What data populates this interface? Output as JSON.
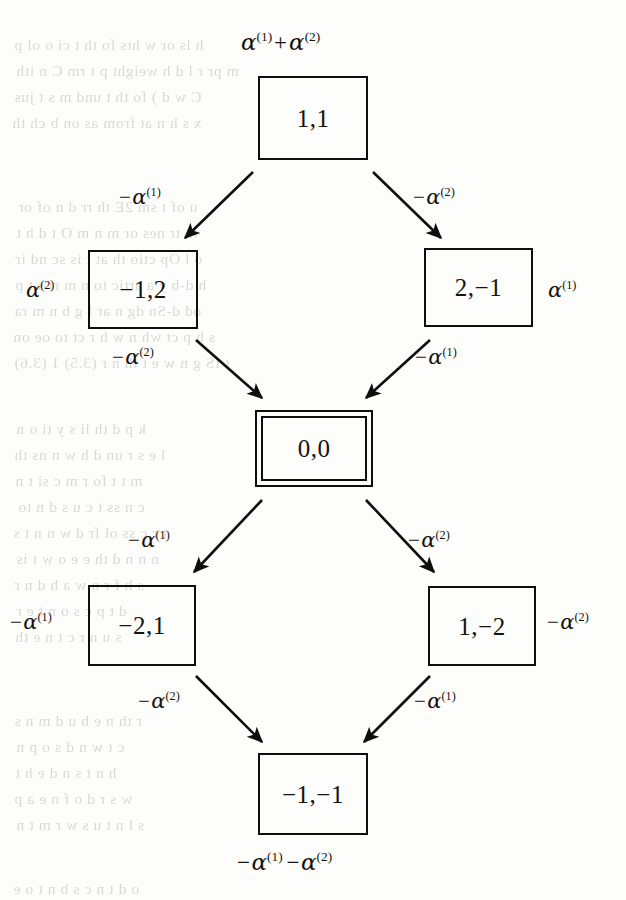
{
  "figure": {
    "type": "weight-lattice-diagram",
    "caption_top": "alpha^(1) + alpha^(2)",
    "caption_bottom": "-alpha^(1) - alpha^(2)"
  },
  "nodes": [
    {
      "id": "top",
      "label": "1,1",
      "double_border": false,
      "x": 258,
      "y": 76,
      "w": 110,
      "h": 84
    },
    {
      "id": "upper-left",
      "label": "−1,2",
      "double_border": false,
      "x": 88,
      "y": 250,
      "w": 110,
      "h": 79
    },
    {
      "id": "upper-right",
      "label": "2,−1",
      "double_border": false,
      "x": 424,
      "y": 248,
      "w": 109,
      "h": 79
    },
    {
      "id": "center",
      "label": "0,0",
      "double_border": true,
      "x": 255,
      "y": 410,
      "w": 118,
      "h": 77
    },
    {
      "id": "lower-left",
      "label": "−2,1",
      "double_border": false,
      "x": 88,
      "y": 585,
      "w": 108,
      "h": 81
    },
    {
      "id": "lower-right",
      "label": "1,−2",
      "double_border": false,
      "x": 428,
      "y": 586,
      "w": 108,
      "h": 80
    },
    {
      "id": "bottom",
      "label": "−1,−1",
      "double_border": false,
      "x": 258,
      "y": 753,
      "w": 110,
      "h": 82
    }
  ],
  "edges": [
    {
      "id": "top-to-upper-left",
      "from": "top",
      "to": "upper-left",
      "label_minus": true,
      "alpha_index": "(1)",
      "x1": 253,
      "y1": 172,
      "x2": 185,
      "y2": 238
    },
    {
      "id": "top-to-upper-right",
      "from": "top",
      "to": "upper-right",
      "label_minus": true,
      "alpha_index": "(2)",
      "x1": 373,
      "y1": 172,
      "x2": 441,
      "y2": 238
    },
    {
      "id": "upper-left-to-center",
      "from": "upper-left",
      "to": "center",
      "label_minus": true,
      "alpha_index": "(2)",
      "x1": 196,
      "y1": 340,
      "x2": 262,
      "y2": 398
    },
    {
      "id": "upper-right-to-center",
      "from": "upper-right",
      "to": "center",
      "label_minus": true,
      "alpha_index": "(1)",
      "x1": 430,
      "y1": 340,
      "x2": 366,
      "y2": 398
    },
    {
      "id": "center-to-lower-left",
      "from": "center",
      "to": "lower-left",
      "label_minus": true,
      "alpha_index": "(1)",
      "x1": 262,
      "y1": 500,
      "x2": 194,
      "y2": 572
    },
    {
      "id": "center-to-lower-right",
      "from": "center",
      "to": "lower-right",
      "label_minus": true,
      "alpha_index": "(2)",
      "x1": 366,
      "y1": 500,
      "x2": 434,
      "y2": 572
    },
    {
      "id": "lower-left-to-bottom",
      "from": "lower-left",
      "to": "bottom",
      "label_minus": true,
      "alpha_index": "(2)",
      "x1": 196,
      "y1": 676,
      "x2": 262,
      "y2": 742
    },
    {
      "id": "lower-right-to-bottom",
      "from": "lower-right",
      "to": "bottom",
      "label_minus": true,
      "alpha_index": "(1)",
      "x1": 430,
      "y1": 676,
      "x2": 364,
      "y2": 742
    }
  ],
  "edge_labels": {
    "top_left": {
      "minus": "−",
      "alpha": "α",
      "sup": "(1)",
      "x": 119,
      "y": 186
    },
    "top_right": {
      "minus": "−",
      "alpha": "α",
      "sup": "(2)",
      "x": 413,
      "y": 186
    },
    "mid_left": {
      "minus": "−",
      "alpha": "α",
      "sup": "(2)",
      "x": 112,
      "y": 346
    },
    "mid_right": {
      "minus": "−",
      "alpha": "α",
      "sup": "(1)",
      "x": 415,
      "y": 346
    },
    "low_left": {
      "minus": "−",
      "alpha": "α",
      "sup": "(1)",
      "x": 128,
      "y": 529
    },
    "low_right": {
      "minus": "−",
      "alpha": "α",
      "sup": "(2)",
      "x": 408,
      "y": 529
    },
    "bottom_left": {
      "minus": "−",
      "alpha": "α",
      "sup": "(2)",
      "x": 138,
      "y": 690
    },
    "bottom_right": {
      "minus": "−",
      "alpha": "α",
      "sup": "(1)",
      "x": 414,
      "y": 690
    }
  },
  "side_labels": {
    "upper_left_side": {
      "minus": "",
      "alpha": "α",
      "sup": "(2)",
      "x": 26,
      "y": 279
    },
    "upper_right_side": {
      "minus": "",
      "alpha": "α",
      "sup": "(1)",
      "x": 548,
      "y": 279
    },
    "lower_left_side": {
      "minus": "−",
      "alpha": "α",
      "sup": "(1)",
      "x": 10,
      "y": 611
    },
    "lower_right_side": {
      "minus": "−",
      "alpha": "α",
      "sup": "(2)",
      "x": 547,
      "y": 611
    }
  },
  "captions": {
    "top": {
      "alpha": "α",
      "sup1": "(1)",
      "plus": "+",
      "sup2": "(2)",
      "x": 241,
      "y": 30
    },
    "bottom": {
      "minus": "−",
      "alpha": "α",
      "sup1": "(1)",
      "sup2": "(2)",
      "x": 237,
      "y": 850
    }
  },
  "ghost_text": {
    "note": "faint mirrored show-through from the reverse side of the printed page",
    "lines": [
      {
        "text": "h ls or w  hts  fo  th     t   ci   o   ol  p",
        "x": 14,
        "y": 36
      },
      {
        "text": "m pr   r  l d h   weight  p   t rm  C n ith",
        "x": 16,
        "y": 62
      },
      {
        "text": "C w  d   ) fo   th  t  und  m  s   t    jus",
        "x": 14,
        "y": 88
      },
      {
        "text": "x s   h n   at   from  as   on   b   ch  th",
        "x": 12,
        "y": 114
      },
      {
        "text": "u  of  t    sm   2E  th  rr  d    n   of  or",
        "x": 18,
        "y": 198
      },
      {
        "text": "in tr  nes   or  m  n   m    O   t   d   h  t",
        "x": 16,
        "y": 224
      },
      {
        "text": "o   l   Op  ctio   th  at  t  is  sc  nd  ir",
        "x": 15,
        "y": 250
      },
      {
        "text": "h  d-b   y a   artic   to  n   m  ri  s  t  p",
        "x": 15,
        "y": 276
      },
      {
        "text": "od  d-Sn  dg   n   ar   l   g   b  n   m   ra",
        "x": 14,
        "y": 302
      },
      {
        "text": "s   h  p   ct  wh  n   w  h  r  ct  to  oe  on",
        "x": 13,
        "y": 328
      },
      {
        "text": "t  IS  g   n w   e   t   th  n   r  (3.5) 1 (3.6)",
        "x": 14,
        "y": 354
      },
      {
        "text": "k p   d   th   li   s   y  ti    o  n",
        "x": 16,
        "y": 420
      },
      {
        "text": "l e   s   r   un  d   h  w   n    ns   th",
        "x": 14,
        "y": 446
      },
      {
        "text": "m   t   t   fo   r    m  c   si    t   n",
        "x": 15,
        "y": 472
      },
      {
        "text": "c  n  ss  t    c   u   s   d   n   to",
        "x": 18,
        "y": 498
      },
      {
        "text": "t r  c  ss  ol   fr  d  w  n   n  t  s",
        "x": 13,
        "y": 524
      },
      {
        "text": "n  n  n  d  th  e   e   o   w  t  is",
        "x": 16,
        "y": 550
      },
      {
        "text": "s  h  f  r n   w   a   h  d   n  r",
        "x": 14,
        "y": 576
      },
      {
        "text": "d  t   p  c  s   o   n   t   e  r",
        "x": 16,
        "y": 602
      },
      {
        "text": "s  u  n   r  c   t   n   e   th",
        "x": 15,
        "y": 628
      },
      {
        "text": "r  th  n  e   b  u  d   m  n   s",
        "x": 14,
        "y": 712
      },
      {
        "text": "c  t   w  n   d   s   o   p   n",
        "x": 16,
        "y": 738
      },
      {
        "text": "h  n   t  s   n   d   e   h  t",
        "x": 15,
        "y": 764
      },
      {
        "text": "w  s   r  d   o   f  n   e   a  p",
        "x": 14,
        "y": 790
      },
      {
        "text": "s  l  n  t   u  s   w   r  m  t  n",
        "x": 16,
        "y": 816
      },
      {
        "text": "o   d  t  n   c  s   b  n  t   o   e",
        "x": 13,
        "y": 880
      }
    ]
  },
  "colors": {
    "ink": "#100e0b",
    "paper": "#fdfdfb",
    "ghost": "#2a2620"
  }
}
